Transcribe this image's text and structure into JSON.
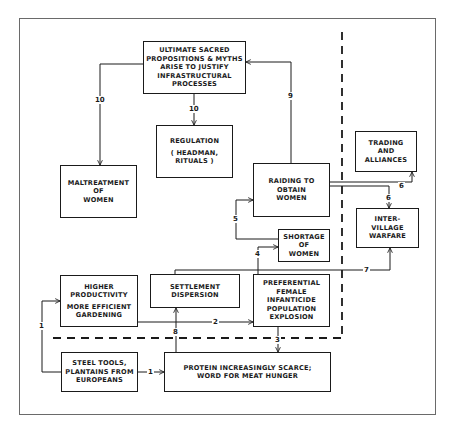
{
  "diagram": {
    "boxes": {
      "sacred": [
        "ULTIMATE SACRED",
        "PROPOSITIONS & MYTHS",
        "ARISE TO JUSTIFY",
        "INFRASTRUCTURAL",
        "PROCESSES"
      ],
      "regulation": [
        "REGULATION",
        "( HEADMAN,",
        "RITUALS )"
      ],
      "maltreatment": [
        "MALTREATMENT",
        "OF",
        "WOMEN"
      ],
      "raiding": [
        "RAIDING TO",
        "OBTAIN",
        "WOMEN"
      ],
      "trading": [
        "TRADING",
        "AND",
        "ALLIANCES"
      ],
      "warfare": [
        "INTER-",
        "VILLAGE",
        "WARFARE"
      ],
      "shortage": [
        "SHORTAGE",
        "OF",
        "WOMEN"
      ],
      "productivity": [
        "HIGHER",
        "PRODUCTIVITY",
        "MORE EFFICIENT",
        "GARDENING"
      ],
      "settlement": [
        "SETTLEMENT",
        "DISPERSION"
      ],
      "infanticide": [
        "PREFERENTIAL",
        "FEMALE",
        "INFANTICIDE",
        "POPULATION",
        "EXPLOSION"
      ],
      "steel": [
        "STEEL TOOLS,",
        "PLANTAINS FROM",
        "EUROPEANS"
      ],
      "protein": [
        "PROTEIN INCREASINGLY SCARCE;",
        "WORD FOR MEAT HUNGER"
      ]
    },
    "edges": [
      {
        "from": "steel",
        "to": "productivity",
        "label": "1"
      },
      {
        "from": "steel",
        "to": "protein",
        "label": "1"
      },
      {
        "from": "productivity",
        "to": "infanticide",
        "label": "2"
      },
      {
        "from": "infanticide",
        "to": "protein",
        "label": "3"
      },
      {
        "from": "infanticide",
        "to": "shortage",
        "label": "4"
      },
      {
        "from": "shortage",
        "to": "raiding",
        "label": "5"
      },
      {
        "from": "raiding",
        "to": "trading",
        "label": "6"
      },
      {
        "from": "raiding",
        "to": "warfare",
        "label": "6"
      },
      {
        "from": "settlement",
        "to": "warfare",
        "label": "7"
      },
      {
        "from": "protein",
        "to": "settlement",
        "label": "8"
      },
      {
        "from": "raiding",
        "to": "sacred",
        "label": "9"
      },
      {
        "from": "sacred",
        "to": "maltreatment",
        "label": "10"
      },
      {
        "from": "sacred",
        "to": "regulation",
        "label": "10"
      }
    ],
    "labels": {
      "l1a": "1",
      "l1b": "1",
      "l2": "2",
      "l3": "3",
      "l4": "4",
      "l5": "5",
      "l6a": "6",
      "l6b": "6",
      "l7": "7",
      "l8": "8",
      "l9": "9",
      "l10a": "10",
      "l10b": "10"
    },
    "colors": {
      "line": "#1a1a1a",
      "frame": "#6a6a6a",
      "background": "#ffffff"
    }
  }
}
